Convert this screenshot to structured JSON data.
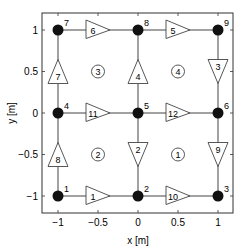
{
  "diagram": {
    "type": "graph-on-axes",
    "xlabel": "x [m]",
    "ylabel": "y [m]",
    "xlim": [
      -1.2,
      1.2
    ],
    "ylim": [
      -1.2,
      1.2
    ],
    "x_ticks": [
      {
        "v": -1,
        "label": "−1"
      },
      {
        "v": -0.5,
        "label": "−0.5"
      },
      {
        "v": 0,
        "label": "0"
      },
      {
        "v": 0.5,
        "label": "0.5"
      },
      {
        "v": 1,
        "label": "1"
      }
    ],
    "y_ticks": [
      {
        "v": -1,
        "label": "−1"
      },
      {
        "v": -0.5,
        "label": "−0.5"
      },
      {
        "v": 0,
        "label": "0"
      },
      {
        "v": 0.5,
        "label": "0.5"
      },
      {
        "v": 1,
        "label": "1"
      }
    ],
    "nodes": [
      {
        "id": "1",
        "x": -1,
        "y": -1
      },
      {
        "id": "2",
        "x": 0,
        "y": -1
      },
      {
        "id": "3",
        "x": 1,
        "y": -1
      },
      {
        "id": "4",
        "x": -1,
        "y": 0
      },
      {
        "id": "5",
        "x": 0,
        "y": 0
      },
      {
        "id": "6",
        "x": 1,
        "y": 0
      },
      {
        "id": "7",
        "x": -1,
        "y": 1
      },
      {
        "id": "8",
        "x": 0,
        "y": 1
      },
      {
        "id": "9",
        "x": 1,
        "y": 1
      }
    ],
    "edges": [
      {
        "id": "1",
        "from": "1",
        "to": "2",
        "dir": "right"
      },
      {
        "id": "10",
        "from": "2",
        "to": "3",
        "dir": "right"
      },
      {
        "id": "11",
        "from": "4",
        "to": "5",
        "dir": "right"
      },
      {
        "id": "12",
        "from": "5",
        "to": "6",
        "dir": "right"
      },
      {
        "id": "6",
        "from": "7",
        "to": "8",
        "dir": "right"
      },
      {
        "id": "5",
        "from": "8",
        "to": "9",
        "dir": "right"
      },
      {
        "id": "8",
        "from": "1",
        "to": "4",
        "dir": "up"
      },
      {
        "id": "7",
        "from": "4",
        "to": "7",
        "dir": "up"
      },
      {
        "id": "2",
        "from": "5",
        "to": "2",
        "dir": "down"
      },
      {
        "id": "4",
        "from": "5",
        "to": "8",
        "dir": "up"
      },
      {
        "id": "9",
        "from": "6",
        "to": "3",
        "dir": "down"
      },
      {
        "id": "3",
        "from": "9",
        "to": "6",
        "dir": "down"
      }
    ],
    "regions": [
      {
        "id": "1",
        "x": 0.5,
        "y": -0.5
      },
      {
        "id": "2",
        "x": -0.5,
        "y": -0.5
      },
      {
        "id": "3",
        "x": -0.5,
        "y": 0.5
      },
      {
        "id": "4",
        "x": 0.5,
        "y": 0.5
      }
    ]
  }
}
